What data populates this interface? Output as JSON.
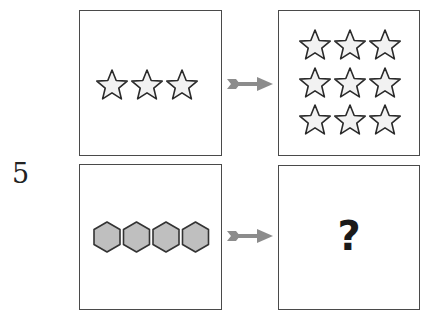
{
  "question": {
    "number": "5",
    "answer_placeholder": "?"
  },
  "colors": {
    "panel_border": "#4a4a4a",
    "star_fill": "#f2f2f2",
    "star_stroke": "#2b2b2b",
    "hexagon_fill": "#bfbfbf",
    "hexagon_stroke": "#333333",
    "arrow": "#8c8c8c"
  },
  "panels": [
    {
      "id": "top-left",
      "shape": "star",
      "count": 3,
      "layout": "row"
    },
    {
      "id": "top-right",
      "shape": "star",
      "count": 9,
      "layout": "3x3 grid"
    },
    {
      "id": "bottom-left",
      "shape": "hexagon",
      "count": 4,
      "layout": "row"
    },
    {
      "id": "bottom-right",
      "shape": "unknown",
      "content": "?"
    }
  ],
  "arrows": [
    {
      "id": "top",
      "direction": "right",
      "icon": "arrow-right-icon"
    },
    {
      "id": "bottom",
      "direction": "right",
      "icon": "arrow-right-icon"
    }
  ]
}
